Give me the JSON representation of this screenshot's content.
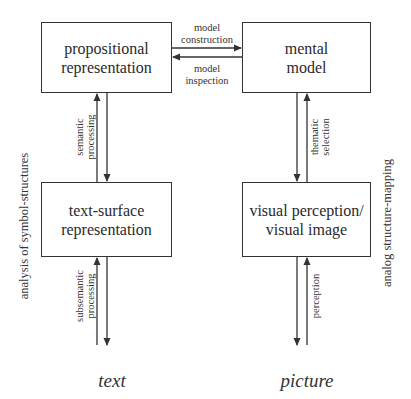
{
  "diagram": {
    "boxes": {
      "propositional": {
        "line1": "propositional",
        "line2": "representation"
      },
      "mental_model": {
        "line1": "mental",
        "line2": "model"
      },
      "text_surface": {
        "line1": "text-surface",
        "line2": "representation"
      },
      "visual": {
        "line1": "visual perception/",
        "line2": "visual image"
      }
    },
    "edges": {
      "model_construction": {
        "line1": "model",
        "line2": "construction"
      },
      "model_inspection": {
        "line1": "model",
        "line2": "inspection"
      },
      "semantic_processing": {
        "line1": "semantic",
        "line2": "processing"
      },
      "thematic_selection": {
        "line1": "thematic",
        "line2": "selection"
      },
      "subsemantic_processing": {
        "line1": "subsemantic",
        "line2": "processing"
      },
      "perception": {
        "line1": "perception"
      }
    },
    "side_labels": {
      "left": "analysis of symbol-structures",
      "right": "analog structure-mapping"
    },
    "sources": {
      "text": "text",
      "picture": "picture"
    },
    "colors": {
      "stroke": "#333333",
      "text": "#2a2a2a",
      "background": "#ffffff"
    }
  }
}
